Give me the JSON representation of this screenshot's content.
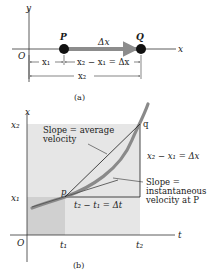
{
  "diagram_a": {
    "y_axis_label": "y",
    "x_axis_label": "x",
    "origin_label": "O",
    "point_p_label": "P",
    "point_q_label": "Q",
    "arrow_label": "Δx",
    "dim_x1": "x₁",
    "dim_diff": "x₂ − x₁ = Δx",
    "dim_x2": "x₂",
    "caption": "(a)"
  },
  "diagram_b": {
    "vertical_axis_label": "x",
    "horizontal_axis_label": "t",
    "origin_label": "O",
    "tick_x2": "x₂",
    "tick_x1": "x₁",
    "tick_t1": "t₁",
    "tick_t2": "t₂",
    "point_p_label": "p",
    "point_q_label": "q",
    "avg_label_line1": "Slope = average",
    "avg_label_line2": "velocity",
    "delta_x_label": "x₂ − x₁ = Δx",
    "delta_t_label": "t₂ − t₁ = Δt",
    "inst_label_line1": "Slope =",
    "inst_label_line2": "instantaneous",
    "inst_label_line3": "velocity at P",
    "caption": "(b)"
  },
  "colors": {
    "axis": "#333333",
    "dot": "#111111",
    "arrow": "#8c8c8c",
    "curve": "#8a8a8a",
    "shade_light": "#e6e6e6",
    "shade_dark": "#cfcfcf",
    "line": "#1a1a1a"
  }
}
